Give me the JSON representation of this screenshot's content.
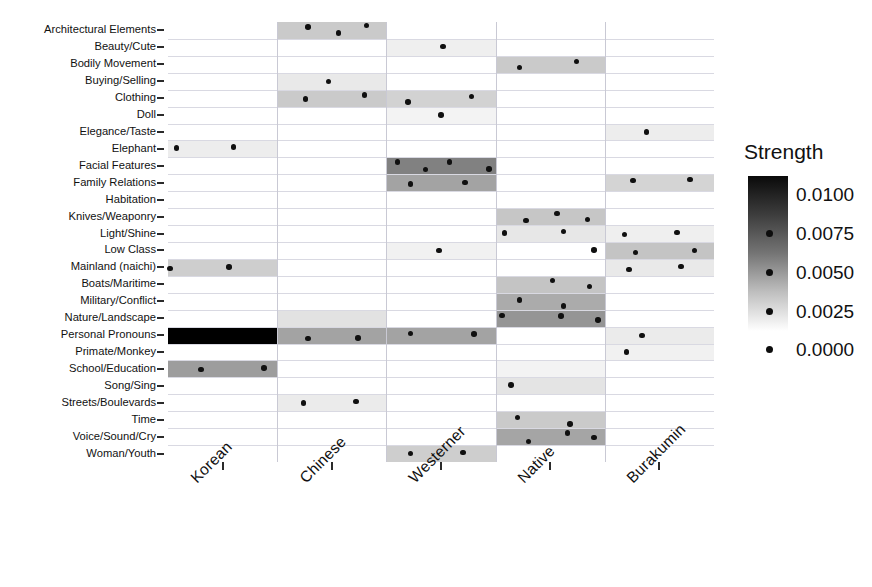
{
  "chart_data": {
    "type": "heatmap",
    "title": "",
    "xlabel": "",
    "ylabel": "",
    "legend_title": "Strength",
    "legend_position": "right",
    "grid": true,
    "colormap": "grayscale-reversed",
    "value_range": [
      0.0,
      0.0125
    ],
    "legend_ticks": [
      "0.0100",
      "0.0075",
      "0.0050",
      "0.0025",
      "0.0000"
    ],
    "legend_tick_values": [
      0.01,
      0.0075,
      0.005,
      0.0025,
      0.0
    ],
    "categories_x": [
      "Korean",
      "Chinese",
      "Westerner",
      "Native",
      "Burakumin"
    ],
    "categories_y": [
      "Architectural Elements",
      "Beauty/Cute",
      "Bodily Movement",
      "Buying/Selling",
      "Clothing",
      "Doll",
      "Elegance/Taste",
      "Elephant",
      "Facial Features",
      "Family Relations",
      "Habitation",
      "Knives/Weaponry",
      "Light/Shine",
      "Low Class",
      "Mainland (naichi)",
      "Boats/Maritime",
      "Military/Conflict",
      "Nature/Landscape",
      "Personal Pronouns",
      "Primate/Monkey",
      "School/Education",
      "Song/Sing",
      "Streets/Boulevards",
      "Time",
      "Voice/Sound/Cry",
      "Woman/Youth"
    ],
    "rows": [
      {
        "label": "Architectural Elements",
        "values": [
          0.0,
          0.0026,
          0.0,
          0.0,
          0.0
        ]
      },
      {
        "label": "Beauty/Cute",
        "values": [
          0.0,
          0.0,
          0.0008,
          0.0,
          0.0
        ]
      },
      {
        "label": "Bodily Movement",
        "values": [
          0.0,
          0.0,
          0.0,
          0.0026,
          0.0
        ]
      },
      {
        "label": "Buying/Selling",
        "values": [
          0.0,
          0.0011,
          0.0,
          0.0,
          0.0
        ]
      },
      {
        "label": "Clothing",
        "values": [
          0.0,
          0.0026,
          0.0022,
          0.0,
          0.0
        ]
      },
      {
        "label": "Doll",
        "values": [
          0.0,
          0.0,
          0.0006,
          0.0,
          0.0
        ]
      },
      {
        "label": "Elegance/Taste",
        "values": [
          0.0,
          0.0,
          0.0,
          0.0,
          0.0009
        ]
      },
      {
        "label": "Elephant",
        "values": [
          0.0009,
          0.0,
          0.0,
          0.0,
          0.0
        ]
      },
      {
        "label": "Facial Features",
        "values": [
          0.0,
          0.0,
          0.0062,
          0.0,
          0.0
        ]
      },
      {
        "label": "Family Relations",
        "values": [
          0.0,
          0.0,
          0.0045,
          0.0,
          0.0021
        ]
      },
      {
        "label": "Habitation",
        "values": [
          0.0,
          0.0,
          0.0,
          0.0,
          0.0
        ]
      },
      {
        "label": "Knives/Weaponry",
        "values": [
          0.0,
          0.0,
          0.0,
          0.0028,
          0.0
        ]
      },
      {
        "label": "Light/Shine",
        "values": [
          0.0,
          0.0,
          0.0,
          0.0012,
          0.0008
        ]
      },
      {
        "label": "Low Class",
        "values": [
          0.0,
          0.0,
          0.0007,
          0.0,
          0.0029
        ]
      },
      {
        "label": "Mainland (naichi)",
        "values": [
          0.0024,
          0.0,
          0.0,
          0.0,
          0.0011
        ]
      },
      {
        "label": "Boats/Maritime",
        "values": [
          0.0,
          0.0,
          0.0,
          0.0029,
          0.0
        ]
      },
      {
        "label": "Military/Conflict",
        "values": [
          0.0,
          0.0,
          0.0,
          0.0041,
          0.0
        ]
      },
      {
        "label": "Nature/Landscape",
        "values": [
          0.0,
          0.0014,
          0.0,
          0.0052,
          0.0
        ]
      },
      {
        "label": "Personal Pronouns",
        "values": [
          0.0125,
          0.0045,
          0.0045,
          0.0,
          0.001
        ]
      },
      {
        "label": "Primate/Monkey",
        "values": [
          0.0,
          0.0,
          0.0,
          0.0,
          0.0007
        ]
      },
      {
        "label": "School/Education",
        "values": [
          0.0048,
          0.0,
          0.0,
          0.0006,
          0.0
        ]
      },
      {
        "label": "Song/Sing",
        "values": [
          0.0,
          0.0,
          0.0,
          0.0013,
          0.0
        ]
      },
      {
        "label": "Streets/Boulevards",
        "values": [
          0.0,
          0.001,
          0.0,
          0.0,
          0.0
        ]
      },
      {
        "label": "Time",
        "values": [
          0.0,
          0.0,
          0.0,
          0.0026,
          0.0
        ]
      },
      {
        "label": "Voice/Sound/Cry",
        "values": [
          0.0,
          0.0,
          0.0,
          0.0044,
          0.0
        ]
      },
      {
        "label": "Woman/Youth",
        "values": [
          0.0,
          0.0,
          0.0024,
          0.0,
          0.0
        ]
      }
    ],
    "points": [
      {
        "row": "Architectural Elements",
        "col": "Chinese",
        "x": 0.28,
        "y": 0.3
      },
      {
        "row": "Architectural Elements",
        "col": "Chinese",
        "x": 0.82,
        "y": 0.22
      },
      {
        "row": "Architectural Elements",
        "col": "Chinese",
        "x": 0.56,
        "y": 0.66
      },
      {
        "row": "Beauty/Cute",
        "col": "Westerner",
        "x": 0.52,
        "y": 0.46
      },
      {
        "row": "Bodily Movement",
        "col": "Native",
        "x": 0.22,
        "y": 0.7
      },
      {
        "row": "Bodily Movement",
        "col": "Native",
        "x": 0.74,
        "y": 0.34
      },
      {
        "row": "Buying/Selling",
        "col": "Chinese",
        "x": 0.47,
        "y": 0.52
      },
      {
        "row": "Clothing",
        "col": "Chinese",
        "x": 0.26,
        "y": 0.54
      },
      {
        "row": "Clothing",
        "col": "Chinese",
        "x": 0.8,
        "y": 0.3
      },
      {
        "row": "Clothing",
        "col": "Westerner",
        "x": 0.2,
        "y": 0.72
      },
      {
        "row": "Clothing",
        "col": "Westerner",
        "x": 0.78,
        "y": 0.4
      },
      {
        "row": "Doll",
        "col": "Westerner",
        "x": 0.5,
        "y": 0.5
      },
      {
        "row": "Elegance/Taste",
        "col": "Burakumin",
        "x": 0.38,
        "y": 0.5
      },
      {
        "row": "Elephant",
        "col": "Korean",
        "x": 0.08,
        "y": 0.46
      },
      {
        "row": "Elephant",
        "col": "Korean",
        "x": 0.6,
        "y": 0.38
      },
      {
        "row": "Facial Features",
        "col": "Westerner",
        "x": 0.1,
        "y": 0.28
      },
      {
        "row": "Facial Features",
        "col": "Westerner",
        "x": 0.58,
        "y": 0.26
      },
      {
        "row": "Facial Features",
        "col": "Westerner",
        "x": 0.36,
        "y": 0.72
      },
      {
        "row": "Facial Features",
        "col": "Westerner",
        "x": 0.94,
        "y": 0.7
      },
      {
        "row": "Family Relations",
        "col": "Westerner",
        "x": 0.22,
        "y": 0.56
      },
      {
        "row": "Family Relations",
        "col": "Westerner",
        "x": 0.72,
        "y": 0.48
      },
      {
        "row": "Family Relations",
        "col": "Burakumin",
        "x": 0.26,
        "y": 0.36
      },
      {
        "row": "Family Relations",
        "col": "Burakumin",
        "x": 0.78,
        "y": 0.32
      },
      {
        "row": "Knives/Weaponry",
        "col": "Native",
        "x": 0.56,
        "y": 0.32
      },
      {
        "row": "Knives/Weaponry",
        "col": "Native",
        "x": 0.28,
        "y": 0.72
      },
      {
        "row": "Knives/Weaponry",
        "col": "Native",
        "x": 0.84,
        "y": 0.68
      },
      {
        "row": "Light/Shine",
        "col": "Native",
        "x": 0.08,
        "y": 0.46
      },
      {
        "row": "Light/Shine",
        "col": "Native",
        "x": 0.62,
        "y": 0.38
      },
      {
        "row": "Light/Shine",
        "col": "Burakumin",
        "x": 0.18,
        "y": 0.56
      },
      {
        "row": "Light/Shine",
        "col": "Burakumin",
        "x": 0.66,
        "y": 0.44
      },
      {
        "row": "Low Class",
        "col": "Westerner",
        "x": 0.48,
        "y": 0.5
      },
      {
        "row": "Low Class",
        "col": "Native",
        "x": 0.9,
        "y": 0.46
      },
      {
        "row": "Low Class",
        "col": "Burakumin",
        "x": 0.28,
        "y": 0.62
      },
      {
        "row": "Low Class",
        "col": "Burakumin",
        "x": 0.82,
        "y": 0.5
      },
      {
        "row": "Mainland (naichi)",
        "col": "Korean",
        "x": 0.02,
        "y": 0.58
      },
      {
        "row": "Mainland (naichi)",
        "col": "Korean",
        "x": 0.56,
        "y": 0.48
      },
      {
        "row": "Mainland (naichi)",
        "col": "Burakumin",
        "x": 0.22,
        "y": 0.62
      },
      {
        "row": "Mainland (naichi)",
        "col": "Burakumin",
        "x": 0.7,
        "y": 0.46
      },
      {
        "row": "Boats/Maritime",
        "col": "Native",
        "x": 0.52,
        "y": 0.28
      },
      {
        "row": "Boats/Maritime",
        "col": "Native",
        "x": 0.86,
        "y": 0.62
      },
      {
        "row": "Military/Conflict",
        "col": "Native",
        "x": 0.22,
        "y": 0.44
      },
      {
        "row": "Military/Conflict",
        "col": "Native",
        "x": 0.62,
        "y": 0.78
      },
      {
        "row": "Nature/Landscape",
        "col": "Native",
        "x": 0.06,
        "y": 0.34
      },
      {
        "row": "Nature/Landscape",
        "col": "Native",
        "x": 0.6,
        "y": 0.36
      },
      {
        "row": "Nature/Landscape",
        "col": "Native",
        "x": 0.94,
        "y": 0.62
      },
      {
        "row": "Personal Pronouns",
        "col": "Chinese",
        "x": 0.28,
        "y": 0.7
      },
      {
        "row": "Personal Pronouns",
        "col": "Chinese",
        "x": 0.74,
        "y": 0.66
      },
      {
        "row": "Personal Pronouns",
        "col": "Westerner",
        "x": 0.22,
        "y": 0.4
      },
      {
        "row": "Personal Pronouns",
        "col": "Westerner",
        "x": 0.8,
        "y": 0.44
      },
      {
        "row": "Personal Pronouns",
        "col": "Burakumin",
        "x": 0.34,
        "y": 0.52
      },
      {
        "row": "Primate/Monkey",
        "col": "Burakumin",
        "x": 0.2,
        "y": 0.5
      },
      {
        "row": "School/Education",
        "col": "Korean",
        "x": 0.3,
        "y": 0.52
      },
      {
        "row": "School/Education",
        "col": "Korean",
        "x": 0.88,
        "y": 0.44
      },
      {
        "row": "Song/Sing",
        "col": "Native",
        "x": 0.14,
        "y": 0.46
      },
      {
        "row": "Streets/Boulevards",
        "col": "Chinese",
        "x": 0.24,
        "y": 0.52
      },
      {
        "row": "Streets/Boulevards",
        "col": "Chinese",
        "x": 0.72,
        "y": 0.42
      },
      {
        "row": "Time",
        "col": "Native",
        "x": 0.2,
        "y": 0.38
      },
      {
        "row": "Time",
        "col": "Native",
        "x": 0.68,
        "y": 0.74
      },
      {
        "row": "Voice/Sound/Cry",
        "col": "Native",
        "x": 0.66,
        "y": 0.3
      },
      {
        "row": "Voice/Sound/Cry",
        "col": "Native",
        "x": 0.9,
        "y": 0.56
      },
      {
        "row": "Voice/Sound/Cry",
        "col": "Native",
        "x": 0.3,
        "y": 0.78
      },
      {
        "row": "Woman/Youth",
        "col": "Westerner",
        "x": 0.22,
        "y": 0.5
      },
      {
        "row": "Woman/Youth",
        "col": "Westerner",
        "x": 0.7,
        "y": 0.44
      }
    ]
  },
  "legend": {
    "title": "Strength"
  }
}
